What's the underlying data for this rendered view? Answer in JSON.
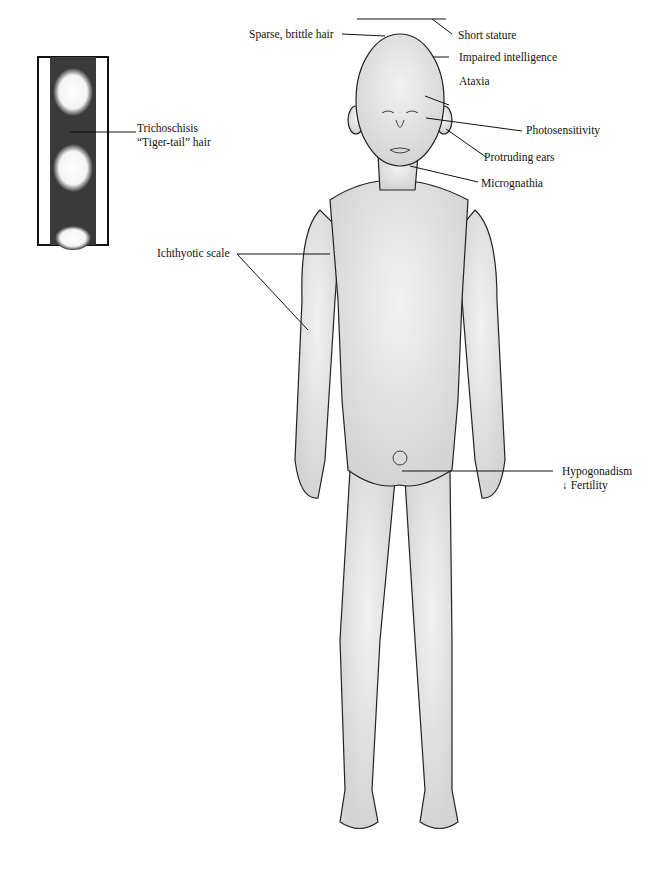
{
  "inset": {
    "label_line1": "Trichoschisis",
    "label_line2": "“Tiger-tail” hair"
  },
  "labels": {
    "sparse_hair": "Sparse, brittle hair",
    "short_stature": "Short stature",
    "impaired_intelligence": "Impaired intelligence",
    "ataxia": "Ataxia",
    "photosensitivity": "Photosensitivity",
    "protruding_ears": "Protruding ears",
    "micrognathia": "Micrognathia",
    "ichthyotic_scale": "Ichthyotic scale",
    "hypogonadism": "Hypogonadism",
    "fertility_arrow": "↓",
    "fertility": "Fertility"
  }
}
